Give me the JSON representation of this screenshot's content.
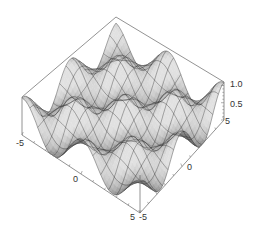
{
  "chart_data": {
    "type": "surface3d",
    "title": "",
    "xlabel": "",
    "ylabel": "",
    "zlabel": "",
    "function_hint": "periodic oscillating surface, 3 x 3 grid of peaks/dips across domain",
    "x_range": [
      -5,
      5
    ],
    "y_range": [
      -5,
      5
    ],
    "z_range": [
      0,
      1.1
    ],
    "x_ticks": [
      -5,
      0,
      5
    ],
    "y_ticks": [
      -5,
      0,
      5
    ],
    "z_ticks": [
      0.5,
      1.0
    ],
    "x_tick_labels": [
      "-5",
      "0",
      "5"
    ],
    "y_tick_labels": [
      "-5",
      "0",
      "5"
    ],
    "z_tick_labels": [
      "0.5",
      "1.0"
    ],
    "mesh_lines": 15,
    "grid": false,
    "legend": "none",
    "box": true,
    "colors": {
      "surface_light": "#e8e8e8",
      "surface_dark": "#2a2a2a",
      "mesh": "#222222",
      "box": "#777777",
      "background": "#ffffff"
    },
    "projection": {
      "top_corner": [
        116,
        17
      ],
      "left_corner": [
        22,
        97
      ],
      "right_corner": [
        224,
        82
      ],
      "front_corner": [
        140,
        175
      ],
      "vertical_height": 38
    }
  }
}
